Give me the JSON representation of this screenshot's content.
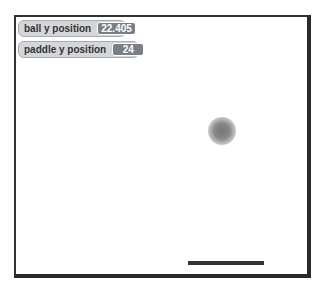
{
  "monitors": [
    {
      "label": "ball y position",
      "value": "22.405"
    },
    {
      "label": "paddle y position",
      "value": "24"
    }
  ],
  "stage": {
    "ball": {
      "x": 192,
      "y": 100,
      "size": 28,
      "color": "#808080"
    },
    "paddle": {
      "x": 172,
      "y": 244,
      "width": 76,
      "color": "#333333"
    }
  }
}
